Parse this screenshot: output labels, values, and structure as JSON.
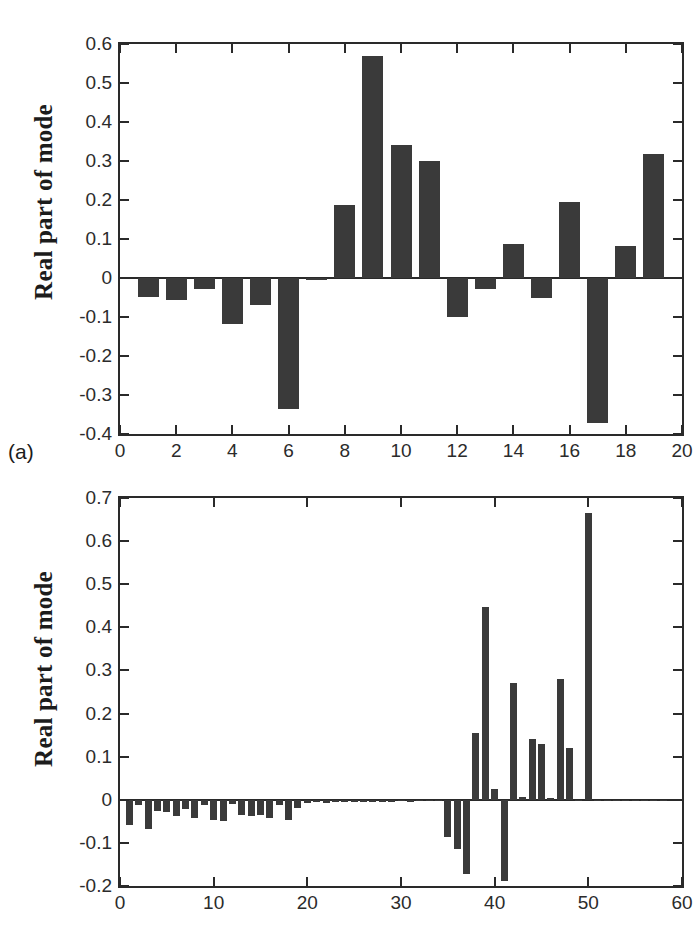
{
  "figure": {
    "background": "#ffffff",
    "bar_color": "#3a3a3a",
    "axis_color": "#2a2a2a"
  },
  "panels": [
    {
      "tag": "(a)",
      "ylabel": "Real part of mode"
    },
    {
      "tag": "(b)",
      "ylabel": "Real part of mode"
    }
  ],
  "chart_data": [
    {
      "type": "bar",
      "panel": "(a)",
      "title": "",
      "xlabel": "",
      "ylabel": "Real part of mode",
      "xlim": [
        0,
        20
      ],
      "ylim": [
        -0.4,
        0.6
      ],
      "grid": false,
      "legend": null,
      "xticks": [
        0,
        2,
        4,
        6,
        8,
        10,
        12,
        14,
        16,
        18,
        20
      ],
      "xticklabels": [
        "0",
        "2",
        "4",
        "6",
        "8",
        "10",
        "12",
        "14",
        "16",
        "18",
        "20"
      ],
      "yticks": [
        -0.4,
        -0.3,
        -0.2,
        -0.1,
        0,
        0.1,
        0.2,
        0.3,
        0.4,
        0.5,
        0.6
      ],
      "yticklabels": [
        "-0.4",
        "-0.3",
        "-0.2",
        "-0.1",
        "0",
        "0.1",
        "0.2",
        "0.3",
        "0.4",
        "0.5",
        "0.6"
      ],
      "x": [
        1,
        2,
        3,
        4,
        5,
        6,
        7,
        8,
        9,
        10,
        11,
        12,
        13,
        14,
        15,
        16,
        17,
        18,
        19
      ],
      "values": [
        -0.048,
        -0.057,
        -0.027,
        -0.118,
        -0.069,
        -0.337,
        -0.005,
        0.186,
        0.568,
        0.341,
        0.301,
        -0.099,
        -0.029,
        0.087,
        -0.052,
        0.196,
        -0.371,
        0.082,
        0.317
      ]
    },
    {
      "type": "bar",
      "panel": "(b)",
      "title": "",
      "xlabel": "",
      "ylabel": "Real part of mode",
      "xlim": [
        0,
        60
      ],
      "ylim": [
        -0.2,
        0.7
      ],
      "grid": false,
      "legend": null,
      "xticks": [
        0,
        10,
        20,
        30,
        40,
        50,
        60
      ],
      "xticklabels": [
        "0",
        "10",
        "20",
        "30",
        "40",
        "50",
        "60"
      ],
      "yticks": [
        -0.2,
        -0.1,
        0,
        0.1,
        0.2,
        0.3,
        0.4,
        0.5,
        0.6,
        0.7
      ],
      "yticklabels": [
        "-0.2",
        "-0.1",
        "0",
        "0.1",
        "0.2",
        "0.3",
        "0.4",
        "0.5",
        "0.6",
        "0.7"
      ],
      "x": [
        1,
        2,
        3,
        4,
        5,
        6,
        7,
        8,
        9,
        10,
        11,
        12,
        13,
        14,
        15,
        16,
        17,
        18,
        19,
        20,
        21,
        22,
        23,
        24,
        25,
        26,
        27,
        28,
        29,
        30,
        31,
        32,
        33,
        34,
        35,
        36,
        37,
        38,
        39,
        40,
        41,
        42,
        43,
        44,
        45,
        46,
        47,
        48,
        49,
        50,
        51,
        52,
        53,
        54,
        55,
        56,
        57,
        58
      ],
      "values": [
        -0.058,
        -0.012,
        -0.068,
        -0.025,
        -0.028,
        -0.038,
        -0.022,
        -0.043,
        -0.011,
        -0.048,
        -0.05,
        -0.01,
        -0.036,
        -0.037,
        -0.036,
        -0.042,
        -0.012,
        -0.048,
        -0.02,
        -0.008,
        -0.006,
        -0.007,
        -0.006,
        -0.005,
        -0.006,
        -0.005,
        -0.005,
        -0.005,
        -0.005,
        -0.004,
        -0.005,
        -0.004,
        -0.004,
        -0.004,
        -0.086,
        -0.115,
        -0.172,
        0.155,
        0.448,
        0.024,
        -0.188,
        0.27,
        0.007,
        0.141,
        0.129,
        0.004,
        0.279,
        0.119,
        -0.003,
        0.665,
        -0.002,
        -0.002,
        -0.002,
        -0.002,
        -0.002,
        -0.002,
        -0.002,
        -0.002
      ]
    }
  ]
}
